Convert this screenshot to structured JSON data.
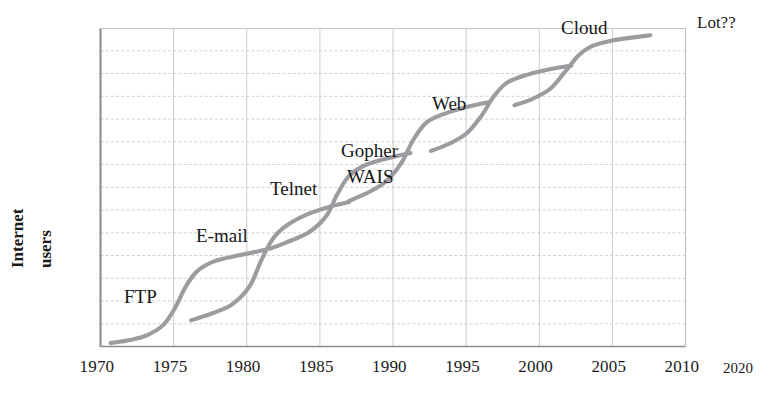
{
  "figure": {
    "kind": "line-chart",
    "background": "#ffffff"
  },
  "axes": {
    "y_title_line1": "Internet",
    "y_title_line2": "users",
    "x_ticks": [
      "1970",
      "1975",
      "1980",
      "1985",
      "1990",
      "1995",
      "2000",
      "2005",
      "2010"
    ],
    "x_extra_tick": "2020",
    "grid_color": "#c9c9cf",
    "axis_color": "#8d8d93"
  },
  "annotations": {
    "top_right": "Lot??",
    "curve_labels": [
      "FTP",
      "E-mail",
      "Telnet",
      "Gopher",
      "WAIS",
      "Web",
      "Cloud"
    ]
  },
  "chart_data": {
    "type": "line",
    "title": "",
    "subtitle": "",
    "xlabel": "",
    "ylabel": "Internet users",
    "xlim": [
      1970,
      2010
    ],
    "ylim": [
      0,
      14
    ],
    "grid": true,
    "legend": "none (inline curve labels)",
    "x_tick_values": [
      1970,
      1975,
      1980,
      1985,
      1990,
      1995,
      2000,
      2005,
      2010
    ],
    "x_tick_labels": [
      "1970",
      "1975",
      "1980",
      "1985",
      "1990",
      "1995",
      "2000",
      "2005",
      "2010"
    ],
    "x_extra_label": "2020",
    "y_tick_labels": [],
    "y_gridline_count": 14,
    "note": "Seven overlapping S-shaped adoption curves; each technology wave rises then plateaus while the next begins, producing a staircase of successive innovations. Axis y is unlabeled/unitless ('Internet users').",
    "series": [
      {
        "name": "FTP",
        "label_x": 1974.2,
        "label_y": 1.9,
        "points": [
          {
            "x": 1970.7,
            "y": 0.15
          },
          {
            "x": 1972.0,
            "y": 0.28
          },
          {
            "x": 1973.2,
            "y": 0.5
          },
          {
            "x": 1974.3,
            "y": 0.95
          },
          {
            "x": 1975.1,
            "y": 1.7
          },
          {
            "x": 1975.8,
            "y": 2.6
          },
          {
            "x": 1976.6,
            "y": 3.3
          },
          {
            "x": 1977.8,
            "y": 3.75
          },
          {
            "x": 1979.4,
            "y": 4.0
          },
          {
            "x": 1981.3,
            "y": 4.25
          }
        ]
      },
      {
        "name": "E-mail",
        "label_x": 1978.0,
        "label_y": 5.35,
        "points": [
          {
            "x": 1976.2,
            "y": 1.15
          },
          {
            "x": 1977.6,
            "y": 1.45
          },
          {
            "x": 1979.0,
            "y": 1.85
          },
          {
            "x": 1980.2,
            "y": 2.65
          },
          {
            "x": 1981.0,
            "y": 3.8
          },
          {
            "x": 1981.8,
            "y": 4.75
          },
          {
            "x": 1982.8,
            "y": 5.35
          },
          {
            "x": 1984.3,
            "y": 5.85
          },
          {
            "x": 1986.0,
            "y": 6.2
          },
          {
            "x": 1987.0,
            "y": 6.35
          }
        ]
      },
      {
        "name": "Telnet",
        "label_x": 1983.3,
        "label_y": 7.15,
        "points": [
          {
            "x": 1981.6,
            "y": 4.3
          },
          {
            "x": 1982.8,
            "y": 4.6
          },
          {
            "x": 1984.2,
            "y": 5.0
          },
          {
            "x": 1985.4,
            "y": 5.7
          },
          {
            "x": 1986.2,
            "y": 6.7
          },
          {
            "x": 1987.0,
            "y": 7.5
          },
          {
            "x": 1988.2,
            "y": 8.0
          },
          {
            "x": 1989.8,
            "y": 8.3
          },
          {
            "x": 1991.2,
            "y": 8.5
          }
        ]
      },
      {
        "name": "Gopher",
        "label_x": 1988.6,
        "label_y": 9.5,
        "points": [
          {
            "x": 1987.0,
            "y": 6.4
          },
          {
            "x": 1988.4,
            "y": 6.8
          },
          {
            "x": 1989.6,
            "y": 7.3
          },
          {
            "x": 1990.6,
            "y": 8.1
          },
          {
            "x": 1991.4,
            "y": 9.1
          },
          {
            "x": 1992.3,
            "y": 9.85
          },
          {
            "x": 1993.6,
            "y": 10.25
          },
          {
            "x": 1995.2,
            "y": 10.55
          },
          {
            "x": 1996.6,
            "y": 10.75
          }
        ]
      },
      {
        "name": "WAIS",
        "label_x": 1988.9,
        "label_y": 8.8,
        "points": [
          {
            "x": 1992.6,
            "y": 8.6
          },
          {
            "x": 1993.8,
            "y": 8.9
          },
          {
            "x": 1995.0,
            "y": 9.35
          },
          {
            "x": 1996.0,
            "y": 10.1
          },
          {
            "x": 1996.9,
            "y": 11.0
          },
          {
            "x": 1997.8,
            "y": 11.6
          },
          {
            "x": 1999.2,
            "y": 11.95
          },
          {
            "x": 2000.8,
            "y": 12.2
          },
          {
            "x": 2002.2,
            "y": 12.35
          }
        ]
      },
      {
        "name": "Web",
        "label_x": 1995.5,
        "label_y": 11.45,
        "points": [
          {
            "x": 1998.3,
            "y": 10.6
          },
          {
            "x": 1999.6,
            "y": 10.9
          },
          {
            "x": 2000.8,
            "y": 11.35
          },
          {
            "x": 2001.8,
            "y": 12.1
          },
          {
            "x": 2002.7,
            "y": 12.8
          },
          {
            "x": 2003.6,
            "y": 13.2
          },
          {
            "x": 2005.0,
            "y": 13.45
          },
          {
            "x": 2006.6,
            "y": 13.6
          },
          {
            "x": 2007.6,
            "y": 13.68
          }
        ]
      },
      {
        "name": "Cloud",
        "label_x": 2003.0,
        "label_y": 13.5,
        "points": []
      }
    ]
  }
}
